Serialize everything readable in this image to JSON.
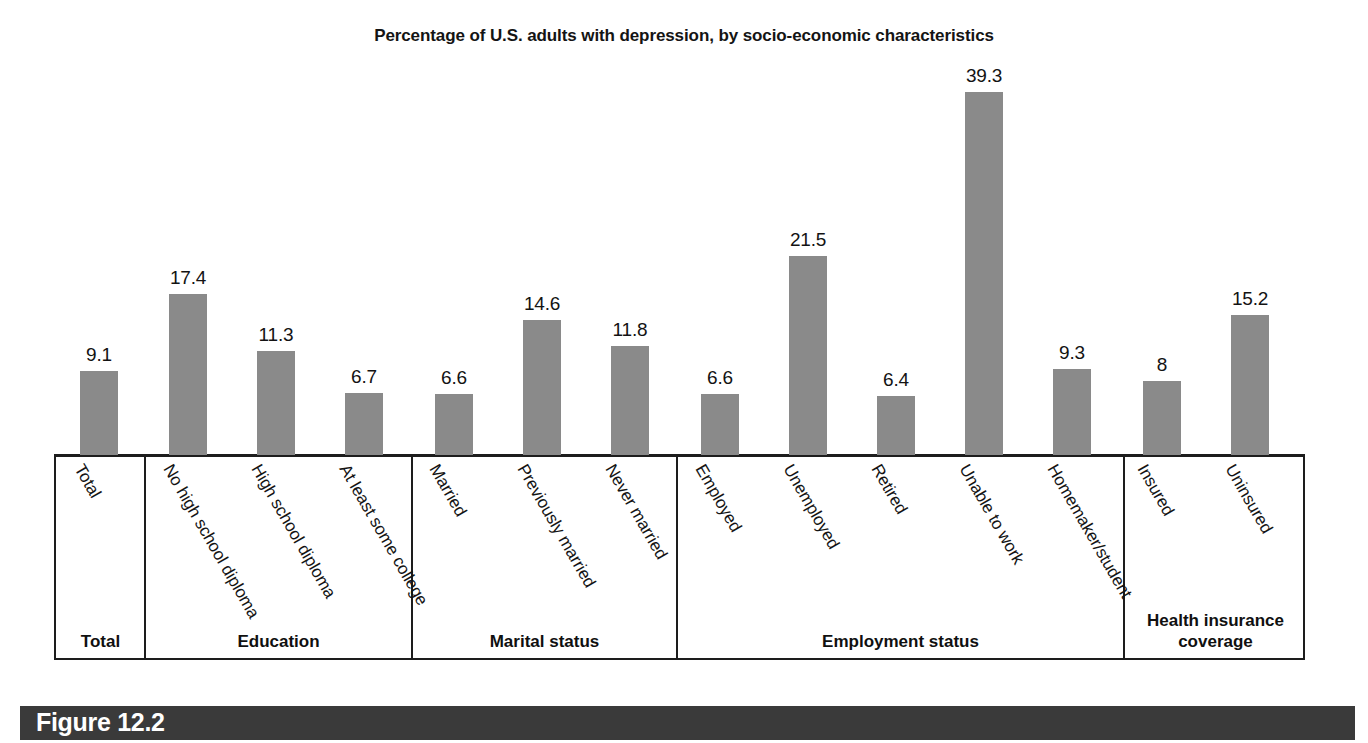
{
  "figure": {
    "caption": "Figure 12.2",
    "caption_bar_color": "#3a3a3a"
  },
  "chart_data": {
    "type": "bar",
    "title": "Percentage of U.S. adults with depression, by socio-economic characteristics",
    "xlabel": "",
    "ylabel": "",
    "ylim": [
      0,
      42
    ],
    "grid": false,
    "legend": null,
    "bar_color": "#8a8a8a",
    "categories": [
      "Total",
      "No high school diploma",
      "High school diploma",
      "At least some college",
      "Married",
      "Previously married",
      "Never married",
      "Employed",
      "Unemployed",
      "Retired",
      "Unable to work",
      "Homemaker/student",
      "Insured",
      "Uninsured"
    ],
    "values": [
      9.1,
      17.4,
      11.3,
      6.7,
      6.6,
      14.6,
      11.8,
      6.6,
      21.5,
      6.4,
      39.3,
      9.3,
      8,
      15.2
    ],
    "value_labels": [
      "9.1",
      "17.4",
      "11.3",
      "6.7",
      "6.6",
      "14.6",
      "11.8",
      "6.6",
      "21.5",
      "6.4",
      "39.3",
      "9.3",
      "8",
      "15.2"
    ],
    "groups": [
      {
        "label": "Total",
        "count": 1
      },
      {
        "label": "Education",
        "count": 3
      },
      {
        "label": "Marital status",
        "count": 3
      },
      {
        "label": "Employment status",
        "count": 5
      },
      {
        "label": "Health insurance coverage",
        "count": 2
      }
    ]
  }
}
